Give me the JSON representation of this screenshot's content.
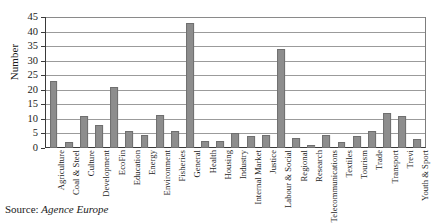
{
  "caption": {
    "prefix": "Source:",
    "source_name": "Agence Europe"
  },
  "chart_data": {
    "type": "bar",
    "title": "",
    "xlabel": "",
    "ylabel": "Number",
    "ylim": [
      0,
      45
    ],
    "ytick_step": 5,
    "yticks": [
      "0",
      "5",
      "10",
      "15",
      "20",
      "25",
      "30",
      "35",
      "40",
      "45"
    ],
    "grid": true,
    "legend": false,
    "bar_color": "#8d8d8d",
    "bar_edge_color": "#6f6f6f",
    "axis_color": "#3a3a3a",
    "gridline_color": "#9b9b9b",
    "categories": [
      "Agriculture",
      "Coal & Steel",
      "Culture",
      "Development",
      "EcoFin",
      "Education",
      "Energy",
      "Environment",
      "Fisheries",
      "General",
      "Health",
      "Housing",
      "Industry",
      "Internal Market",
      "Justice",
      "Labour & Social",
      "Regional",
      "Research",
      "Telecommunications",
      "Textiles",
      "Tourism",
      "Trade",
      "Transport",
      "Trevi",
      "Youth & Sport"
    ],
    "values": [
      23,
      2,
      11,
      8,
      21,
      6,
      4.5,
      11.5,
      6,
      43,
      2.5,
      2.5,
      5,
      4,
      4.5,
      34,
      3.5,
      1,
      4.5,
      2,
      4,
      6,
      12,
      11,
      3
    ]
  }
}
